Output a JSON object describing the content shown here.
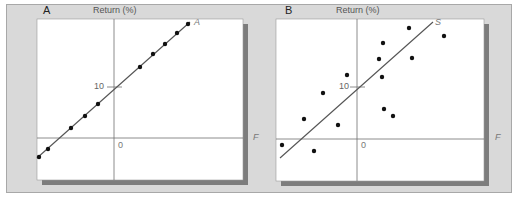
{
  "chart_data": [
    {
      "type": "scatter",
      "panel_label": "A",
      "title": "",
      "ylabel": "Return (%)",
      "xlabel": "F",
      "origin_label": "0",
      "y_tick_labels": [
        "10"
      ],
      "line_label": "A",
      "grid": false,
      "legend": null,
      "fit_line": {
        "x1": -15,
        "y1": -3.9,
        "x2": 15,
        "y2": 22.8
      },
      "points": [
        {
          "x": -14.7,
          "y": -3.7
        },
        {
          "x": -12.9,
          "y": -2.2
        },
        {
          "x": -8.4,
          "y": 2.0
        },
        {
          "x": -5.7,
          "y": 4.3
        },
        {
          "x": -3.1,
          "y": 6.7
        },
        {
          "x": 5.1,
          "y": 13.9
        },
        {
          "x": 7.6,
          "y": 16.5
        },
        {
          "x": 10.0,
          "y": 18.4
        },
        {
          "x": 12.4,
          "y": 20.6
        },
        {
          "x": 14.5,
          "y": 22.4
        }
      ]
    },
    {
      "type": "scatter",
      "panel_label": "B",
      "title": "",
      "ylabel": "Return (%)",
      "xlabel": "F",
      "origin_label": "0",
      "y_tick_labels": [
        "10"
      ],
      "line_label": "S",
      "grid": false,
      "legend": null,
      "fit_line": {
        "x1": -15,
        "y1": -3.8,
        "x2": 15,
        "y2": 22.9
      },
      "points": [
        {
          "x": -14.7,
          "y": -1.2
        },
        {
          "x": -10.4,
          "y": 3.9
        },
        {
          "x": -8.4,
          "y": -2.4
        },
        {
          "x": -6.5,
          "y": 9.2
        },
        {
          "x": -3.7,
          "y": 2.7
        },
        {
          "x": -1.9,
          "y": 12.7
        },
        {
          "x": 4.3,
          "y": 15.5
        },
        {
          "x": 4.5,
          "y": 12.4
        },
        {
          "x": 5.1,
          "y": 9.5
        },
        {
          "x": 5.1,
          "y": 18.6
        },
        {
          "x": 7.0,
          "y": 4.5
        },
        {
          "x": 10.2,
          "y": 21.6
        },
        {
          "x": 10.8,
          "y": 15.9
        },
        {
          "x": 16.9,
          "y": 20.0
        }
      ]
    }
  ],
  "render": {
    "panels": [
      {
        "panel_label": "A",
        "ylabel": "Return (%)",
        "xlabel": "F",
        "origin_label": "0",
        "tick_label": "10",
        "line_label": "A",
        "box": {
          "x": 37,
          "y": 19,
          "w": 206,
          "h": 161
        },
        "axis_x": 114,
        "axis_y": 138,
        "tick_y": 87,
        "line": [
          37,
          158,
          190,
          22
        ],
        "pts": [
          [
            39,
            157
          ],
          [
            48,
            149
          ],
          [
            71,
            128
          ],
          [
            85,
            116
          ],
          [
            98,
            104
          ],
          [
            140,
            67
          ],
          [
            153,
            54
          ],
          [
            165,
            44
          ],
          [
            177,
            33
          ],
          [
            188,
            24
          ]
        ]
      },
      {
        "panel_label": "B",
        "ylabel": "Return (%)",
        "xlabel": "F",
        "origin_label": "0",
        "tick_label": "10",
        "line_label": "S",
        "box": {
          "x": 276,
          "y": 19,
          "w": 208,
          "h": 162
        },
        "axis_x": 357,
        "axis_y": 139,
        "tick_y": 87,
        "line": [
          280,
          158,
          433,
          22
        ],
        "pts": [
          [
            282,
            145
          ],
          [
            304,
            119
          ],
          [
            314,
            151
          ],
          [
            323,
            93
          ],
          [
            338,
            125
          ],
          [
            347,
            75
          ],
          [
            379,
            59
          ],
          [
            382,
            77
          ],
          [
            383,
            43
          ],
          [
            384,
            109
          ],
          [
            393,
            116
          ],
          [
            409,
            28
          ],
          [
            412,
            58
          ],
          [
            444,
            36
          ]
        ]
      }
    ],
    "colors": {
      "frame_bg": "#d9d9d9",
      "plot_bg": "#ffffff",
      "shadow": "#7d7d7d",
      "axis": "#6e6e6e",
      "points": "#111111",
      "text": "#555555",
      "panel_label": "#222222"
    }
  }
}
